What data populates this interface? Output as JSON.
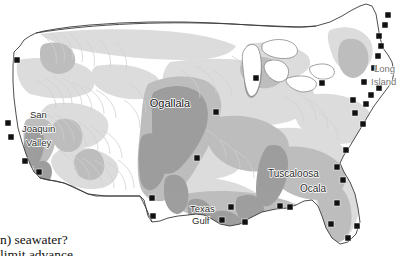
{
  "figure": {
    "type": "map",
    "background_color": "#ffffff",
    "outline_color": "#3a3a3a",
    "marker_color": "#111111",
    "shades": {
      "light_aquifer": "#dcdcdc",
      "medium_aquifer": "#bdbdbd",
      "dark_aquifer": "#9e9e9e",
      "water": "#ffffff"
    }
  },
  "labels": [
    {
      "id": "ogallala",
      "text": "Ogallala",
      "x": 170,
      "y": 107,
      "anchor": "middle"
    },
    {
      "id": "san",
      "text": "San",
      "x": 30,
      "y": 118,
      "anchor": "start"
    },
    {
      "id": "joaquin",
      "text": "Joaquin",
      "x": 22,
      "y": 132,
      "anchor": "start"
    },
    {
      "id": "valley",
      "text": "Valley",
      "x": 26,
      "y": 146,
      "anchor": "start"
    },
    {
      "id": "tuscaloosa",
      "text": "Tuscaloosa",
      "x": 268,
      "y": 177,
      "anchor": "start"
    },
    {
      "id": "ocala",
      "text": "Ocala",
      "x": 300,
      "y": 192,
      "anchor": "start"
    },
    {
      "id": "texas",
      "text": "Texas",
      "x": 190,
      "y": 212,
      "anchor": "start"
    },
    {
      "id": "gulf",
      "text": "Gulf",
      "x": 192,
      "y": 224,
      "anchor": "start"
    },
    {
      "id": "long",
      "text": "Long",
      "x": 374,
      "y": 72,
      "anchor": "start",
      "faint": true
    },
    {
      "id": "island",
      "text": "Island",
      "x": 371,
      "y": 85,
      "anchor": "start",
      "faint": true
    }
  ],
  "markers": [
    {
      "id": "m-wa-coast",
      "x": 17,
      "y": 60
    },
    {
      "id": "m-ca-north",
      "x": 8,
      "y": 123
    },
    {
      "id": "m-ca-bay",
      "x": 11,
      "y": 137
    },
    {
      "id": "m-ca-central",
      "x": 25,
      "y": 161
    },
    {
      "id": "m-ca-south",
      "x": 39,
      "y": 172
    },
    {
      "id": "m-tx-west",
      "x": 152,
      "y": 198
    },
    {
      "id": "m-tx-southwest",
      "x": 153,
      "y": 216
    },
    {
      "id": "m-ks",
      "x": 197,
      "y": 158
    },
    {
      "id": "m-ne",
      "x": 216,
      "y": 112
    },
    {
      "id": "m-il",
      "x": 256,
      "y": 78
    },
    {
      "id": "m-oh",
      "x": 322,
      "y": 83
    },
    {
      "id": "m-tx-gulf",
      "x": 231,
      "y": 207
    },
    {
      "id": "m-la-gulf",
      "x": 222,
      "y": 220
    },
    {
      "id": "m-ms-gulf",
      "x": 245,
      "y": 222
    },
    {
      "id": "m-al-gulf",
      "x": 280,
      "y": 206
    },
    {
      "id": "m-fl-panhandle",
      "x": 290,
      "y": 207
    },
    {
      "id": "m-fl-ne",
      "x": 343,
      "y": 180
    },
    {
      "id": "m-fl-central",
      "x": 337,
      "y": 203
    },
    {
      "id": "m-fl-swcoast",
      "x": 331,
      "y": 224
    },
    {
      "id": "m-fl-south",
      "x": 348,
      "y": 238
    },
    {
      "id": "m-fl-se",
      "x": 357,
      "y": 226
    },
    {
      "id": "m-ga-coast",
      "x": 337,
      "y": 167
    },
    {
      "id": "m-sc-coast",
      "x": 346,
      "y": 150
    },
    {
      "id": "m-nc-coast",
      "x": 363,
      "y": 124
    },
    {
      "id": "m-va-coast",
      "x": 355,
      "y": 113
    },
    {
      "id": "m-md-coast",
      "x": 366,
      "y": 104
    },
    {
      "id": "m-de-coast",
      "x": 353,
      "y": 100
    },
    {
      "id": "m-nj-coast",
      "x": 371,
      "y": 95
    },
    {
      "id": "m-li-east",
      "x": 379,
      "y": 88
    },
    {
      "id": "m-ny-li",
      "x": 364,
      "y": 82
    },
    {
      "id": "m-ct-coast",
      "x": 374,
      "y": 68
    },
    {
      "id": "m-ri-coast",
      "x": 378,
      "y": 56
    },
    {
      "id": "m-ma-coast",
      "x": 381,
      "y": 46
    },
    {
      "id": "m-nh-coast",
      "x": 379,
      "y": 36
    },
    {
      "id": "m-me-coast",
      "x": 385,
      "y": 25
    },
    {
      "id": "m-me-north",
      "x": 388,
      "y": 15
    }
  ],
  "caption": {
    "line1": "n) seawater?",
    "line2": "limit advance"
  }
}
